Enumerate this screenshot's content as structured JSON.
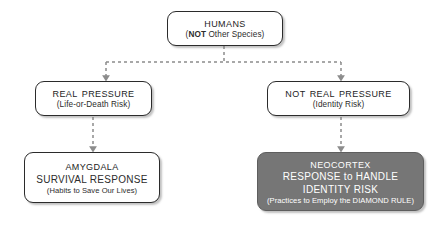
{
  "diagram": {
    "background_color": "#ffffff",
    "box_fill": "#ffffff",
    "box_border_color": "#2b2b2b",
    "highlight_fill": "#767676",
    "highlight_text_color": "#ffffff",
    "connector_color": "#8c8c8c",
    "nodes": {
      "humans": {
        "title": "Humans",
        "sub_prefix": "(",
        "sub_bold": "NOT",
        "sub_rest": " Other Species)"
      },
      "real_pressure": {
        "title": "Real Pressure",
        "sub": "(Life-or-Death Risk)"
      },
      "not_real_pressure": {
        "title": "Not Real Pressure",
        "sub": "(Identity Risk)"
      },
      "amygdala": {
        "title": "Amygdala",
        "line2": "SURVIVAL RESPONSE",
        "line3": "(Habits to Save Our Lives)"
      },
      "neocortex": {
        "title": "Neocortex",
        "line2": "RESPONSE to HANDLE",
        "line3": "IDENTITY RISK",
        "line4": "(Practices to Employ the DIAMOND RULE)"
      }
    }
  }
}
